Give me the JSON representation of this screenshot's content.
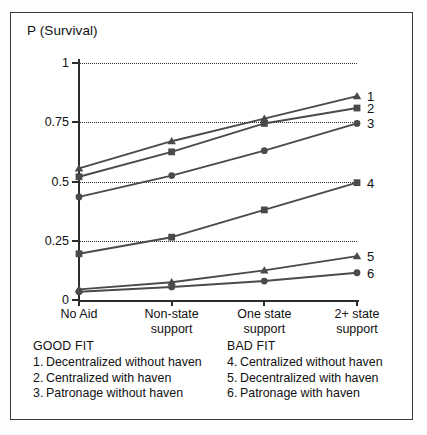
{
  "chart_data": {
    "type": "line",
    "title": "",
    "ylabel": "P (Survival)",
    "xlabel": "",
    "categories": [
      "No Aid",
      "Non-state support",
      "One state support",
      "2+ state support"
    ],
    "category_lines": [
      [
        "No Aid"
      ],
      [
        "Non-state",
        "support"
      ],
      [
        "One state",
        "support"
      ],
      [
        "2+ state",
        "support"
      ]
    ],
    "ylim": [
      0,
      1
    ],
    "yticks": [
      0,
      0.25,
      0.5,
      0.75,
      1
    ],
    "ytick_labels": [
      "0",
      "0.25",
      "0.5",
      "0.75",
      "1"
    ],
    "grid": "horizontal-dotted",
    "legend_position": "right-edge-numbers",
    "series": [
      {
        "name": "1",
        "label": "Decentralized without haven",
        "group": "GOOD FIT",
        "marker": "triangle",
        "color": "#4a4a4a",
        "values": [
          0.555,
          0.67,
          0.765,
          0.86
        ]
      },
      {
        "name": "2",
        "label": "Centralized with haven",
        "group": "GOOD FIT",
        "marker": "square",
        "color": "#4a4a4a",
        "values": [
          0.52,
          0.625,
          0.745,
          0.81
        ]
      },
      {
        "name": "3",
        "label": "Patronage without haven",
        "group": "GOOD FIT",
        "marker": "circle",
        "color": "#4a4a4a",
        "values": [
          0.435,
          0.525,
          0.63,
          0.745
        ]
      },
      {
        "name": "4",
        "label": "Centralized without haven",
        "group": "BAD FIT",
        "marker": "square",
        "color": "#4a4a4a",
        "values": [
          0.195,
          0.265,
          0.38,
          0.495
        ]
      },
      {
        "name": "5",
        "label": "Decentralized with haven",
        "group": "BAD FIT",
        "marker": "triangle",
        "color": "#4a4a4a",
        "values": [
          0.045,
          0.075,
          0.125,
          0.185
        ]
      },
      {
        "name": "6",
        "label": "Patronage with haven",
        "group": "BAD FIT",
        "marker": "circle",
        "color": "#4a4a4a",
        "values": [
          0.035,
          0.055,
          0.08,
          0.115
        ]
      }
    ]
  },
  "legend": {
    "good": {
      "heading": "GOOD FIT",
      "items": [
        {
          "num": "1.",
          "text": "Decentralized without haven"
        },
        {
          "num": "2.",
          "text": "Centralized with haven"
        },
        {
          "num": "3.",
          "text": "Patronage without haven"
        }
      ]
    },
    "bad": {
      "heading": "BAD FIT",
      "items": [
        {
          "num": "4.",
          "text": "Centralized without haven"
        },
        {
          "num": "5.",
          "text": "Decentralized with haven"
        },
        {
          "num": "6.",
          "text": "Patronage with haven"
        }
      ]
    }
  },
  "style": {
    "line_color": "#4a4a4a",
    "axis_color": "#2c2c2c",
    "grid_color": "#2b2b2b",
    "frame_color": "#3a3a3a",
    "text_color": "#111111",
    "background": "#ffffff"
  }
}
